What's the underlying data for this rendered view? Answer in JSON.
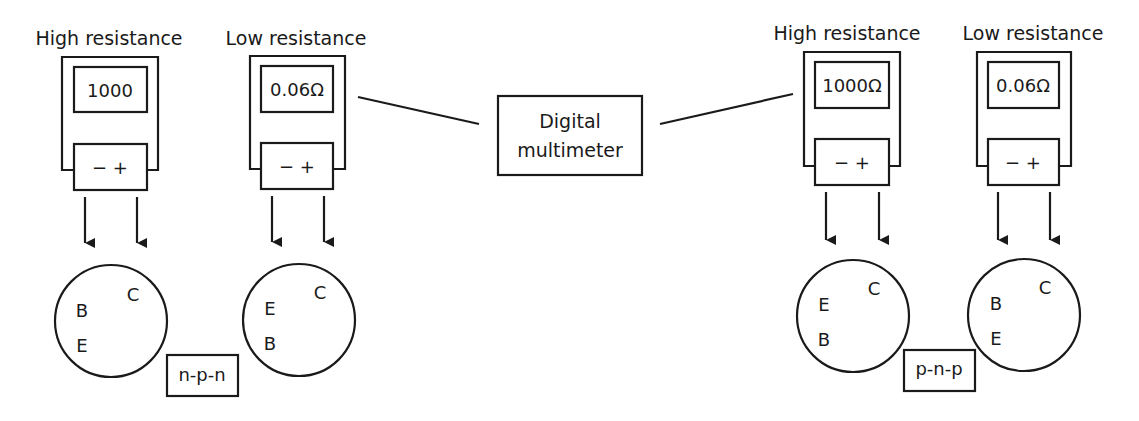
{
  "diagram": {
    "center_label": {
      "line1": "Digital",
      "line2": "multimeter"
    },
    "groups": [
      {
        "type_label": "n-p-n",
        "meters": [
          {
            "label": "High resistance",
            "reading": "1000",
            "terminals": "− +",
            "pins": {
              "upper_left": "B",
              "lower_left": "E",
              "right": "C"
            }
          },
          {
            "label": "Low resistance",
            "reading": "0.06Ω",
            "terminals": "− +",
            "pins": {
              "upper_left": "E",
              "lower_left": "B",
              "right": "C"
            }
          }
        ]
      },
      {
        "type_label": "p-n-p",
        "meters": [
          {
            "label": "High resistance",
            "reading": "1000Ω",
            "terminals": "− +",
            "pins": {
              "upper_left": "E",
              "lower_left": "B",
              "right": "C"
            }
          },
          {
            "label": "Low resistance",
            "reading": "0.06Ω",
            "terminals": "− +",
            "pins": {
              "upper_left": "B",
              "lower_left": "E",
              "right": "C"
            }
          }
        ]
      }
    ],
    "colors": {
      "stroke": "#1a1a1a",
      "background": "#ffffff"
    }
  }
}
